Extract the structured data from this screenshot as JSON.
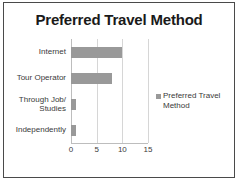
{
  "chart_data": {
    "type": "bar",
    "orientation": "horizontal",
    "title": "Preferred Travel Method",
    "categories": [
      "Internet",
      "Tour Operator",
      "Through Job/\nStudies",
      "Independently"
    ],
    "values": [
      10,
      8,
      1,
      1
    ],
    "series": [
      {
        "name": "Preferred Travel Method",
        "values": [
          10,
          8,
          1,
          1
        ],
        "color": "#999999"
      }
    ],
    "xlabel": "",
    "ylabel": "",
    "xlim": [
      0,
      15
    ],
    "xticks": [
      0,
      5,
      10,
      15
    ],
    "xtick_labels": [
      "0",
      "5",
      "10",
      "15"
    ],
    "grid": true,
    "grid_axis": "x",
    "legend": {
      "position": "right",
      "entries": [
        "Preferred Travel Method"
      ]
    }
  },
  "colors": {
    "bar": "#999999",
    "gridline": "#d6d6d6",
    "axis": "#bdbdbd",
    "border": "#4a4a4a",
    "title_text": "#1a1a1a",
    "label_text": "#3a3a3a",
    "background": "#ffffff"
  }
}
